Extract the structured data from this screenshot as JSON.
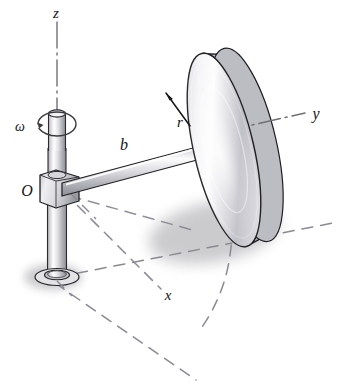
{
  "figure": {
    "background_color": "#ffffff",
    "width": 340,
    "height": 389
  },
  "labels": {
    "z_axis": "z",
    "y_axis": "y",
    "x_axis": "x",
    "origin": "O",
    "angular_velocity": "ω",
    "arm_length": "b",
    "disk_radius": "r"
  },
  "colors": {
    "outline": "#1a1a1a",
    "axis_line": "#6f6f77",
    "construction_line": "#8a8a92",
    "metal_light": "#fbfbfb",
    "metal_mid": "#c9c9cd",
    "metal_dark": "#8e8e95",
    "shadow": "#9a9a9f",
    "label_text": "#151515"
  },
  "parts": {
    "vertical_shaft": "vertical-shaft",
    "shaft_upper": "shaft-upper-section",
    "shaft_base": "shaft-base-collar",
    "hub": "hub-block",
    "horizontal_arm": "horizontal-arm",
    "disk": "disk",
    "rotation_arrow": "rotation-arrow"
  },
  "annotations": {
    "z_axis_style": "dash-dot vertical line through shaft centerline",
    "y_axis_style": "dash-dot line through disk axis toward right",
    "x_axis_style": "dashed line from origin toward lower right",
    "swept_path_style": "dashed arc showing circular path of the disk",
    "ground_plane_style": "dashed construction lines on horizontal plane"
  }
}
